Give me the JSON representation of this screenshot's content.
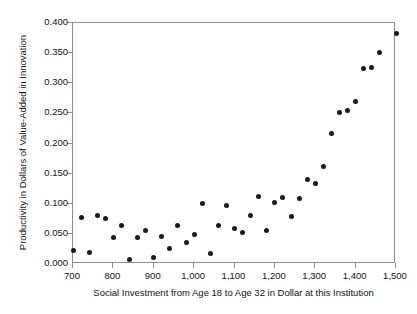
{
  "chart_data": {
    "type": "scatter",
    "title": "",
    "xlabel": "Social Investment from Age 18 to Age 32 in Dollar at this Institution",
    "ylabel": "Productivity in Dollars of Value-Added in Innovation",
    "xlim": [
      700,
      1500
    ],
    "ylim": [
      0.0,
      0.4
    ],
    "xticks": [
      700,
      800,
      900,
      1000,
      1100,
      1200,
      1300,
      1400,
      1500
    ],
    "xticklabels": [
      "700",
      "800",
      "900",
      "1,000",
      "1,100",
      "1,200",
      "1,300",
      "1,400",
      "1,500"
    ],
    "yticks": [
      0.0,
      0.05,
      0.1,
      0.15,
      0.2,
      0.25,
      0.3,
      0.35,
      0.4
    ],
    "yticklabels": [
      "0.000",
      "0.050",
      "0.100",
      "0.150",
      "0.200",
      "0.250",
      "0.300",
      "0.350",
      "0.400"
    ],
    "grid": false,
    "legend": false,
    "marker": {
      "shape": "circle",
      "color": "#1a1a1a",
      "size": 5
    },
    "series": [
      {
        "name": "Productivity vs Social Investment",
        "x": [
          700,
          720,
          740,
          760,
          780,
          800,
          820,
          840,
          860,
          880,
          900,
          920,
          940,
          960,
          980,
          1000,
          1020,
          1040,
          1060,
          1080,
          1100,
          1120,
          1140,
          1160,
          1180,
          1200,
          1220,
          1240,
          1260,
          1280,
          1300,
          1320,
          1340,
          1360,
          1380,
          1400,
          1420,
          1440,
          1460,
          1500
        ],
        "y": [
          0.023,
          0.077,
          0.019,
          0.08,
          0.075,
          0.044,
          0.064,
          0.007,
          0.044,
          0.056,
          0.011,
          0.045,
          0.025,
          0.064,
          0.035,
          0.049,
          0.101,
          0.017,
          0.064,
          0.097,
          0.059,
          0.052,
          0.081,
          0.112,
          0.056,
          0.102,
          0.11,
          0.079,
          0.109,
          0.14,
          0.134,
          0.162,
          0.217,
          0.251,
          0.255,
          0.27,
          0.325,
          0.326,
          0.351,
          0.383
        ]
      }
    ]
  },
  "axes": {
    "x_title": "Social Investment from Age 18 to Age 32 in Dollar at this Institution",
    "y_title": "Productivity in Dollars of Value-Added in Innovation"
  }
}
